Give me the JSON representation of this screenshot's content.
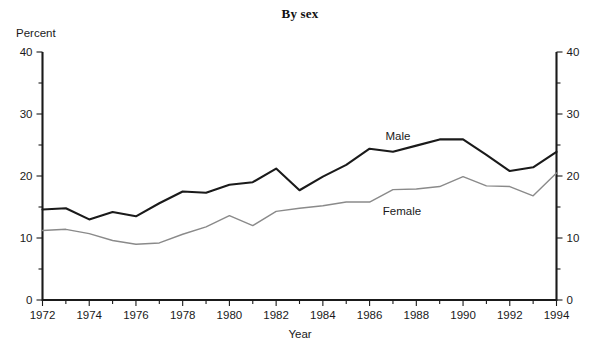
{
  "chart_data": {
    "type": "line",
    "title": "By sex",
    "xlabel": "Year",
    "ylabel": "Percent",
    "ylim": [
      0,
      40
    ],
    "xlim": [
      1972,
      1994
    ],
    "grid": false,
    "legend_position": "inline-annotations",
    "y_ticks": [
      0,
      10,
      20,
      30,
      40
    ],
    "y_tick_labels": [
      "0",
      "10",
      "20",
      "30",
      "40"
    ],
    "y_minor_ticks": [
      5,
      15,
      25,
      35
    ],
    "y_axis_right": true,
    "y_ticks_right": [
      0,
      10,
      20,
      30,
      40
    ],
    "y_tick_labels_right": [
      "0",
      "10",
      "20",
      "30",
      "40"
    ],
    "x_ticks": [
      1972,
      1973,
      1974,
      1975,
      1976,
      1977,
      1978,
      1979,
      1980,
      1981,
      1982,
      1983,
      1984,
      1985,
      1986,
      1987,
      1988,
      1989,
      1990,
      1991,
      1992,
      1993,
      1994
    ],
    "x_tick_labels_shown": [
      "1972",
      "1974",
      "1976",
      "1978",
      "1980",
      "1982",
      "1984",
      "1986",
      "1988",
      "1990",
      "1992",
      "1994"
    ],
    "x": [
      1972,
      1973,
      1974,
      1975,
      1976,
      1977,
      1978,
      1979,
      1980,
      1981,
      1982,
      1983,
      1984,
      1985,
      1986,
      1987,
      1988,
      1989,
      1990,
      1991,
      1992,
      1993,
      1994
    ],
    "series": [
      {
        "name": "Male",
        "color": "#1a1a1a",
        "line_width": 2.1,
        "annotation": "Male",
        "values": [
          14.6,
          14.8,
          13.0,
          14.2,
          13.5,
          15.6,
          17.5,
          17.3,
          18.6,
          19.0,
          21.2,
          17.7,
          19.9,
          21.8,
          24.4,
          23.9,
          24.9,
          25.9,
          25.9,
          23.4,
          20.8,
          21.4,
          23.9
        ]
      },
      {
        "name": "Female",
        "color": "#8a8a8a",
        "line_width": 1.4,
        "annotation": "Female",
        "values": [
          11.2,
          11.4,
          10.7,
          9.6,
          9.0,
          9.2,
          10.6,
          11.8,
          13.6,
          12.0,
          14.3,
          14.8,
          15.2,
          15.8,
          15.8,
          17.8,
          17.9,
          18.3,
          19.9,
          18.4,
          18.3,
          16.8,
          20.5
        ]
      }
    ]
  },
  "annotations": {
    "male_label": "Male",
    "female_label": "Female"
  }
}
